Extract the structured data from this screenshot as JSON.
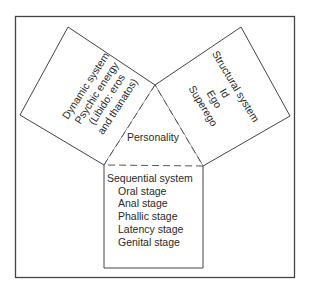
{
  "diagram": {
    "center": {
      "label": "Personality"
    },
    "dynamic": {
      "title": "Dynamic system",
      "items": [
        "Psychic energy",
        "(Libido: eros",
        "and thanatos)"
      ]
    },
    "structural": {
      "title": "Structural system",
      "items": [
        "Id",
        "Ego",
        "Superego"
      ]
    },
    "sequential": {
      "title": "Sequential system",
      "items": [
        "Oral stage",
        "Anal stage",
        "Phallic stage",
        "Latency stage",
        "Genital stage"
      ]
    },
    "colors": {
      "line": "#3a3a3a",
      "background": "#ffffff"
    }
  }
}
